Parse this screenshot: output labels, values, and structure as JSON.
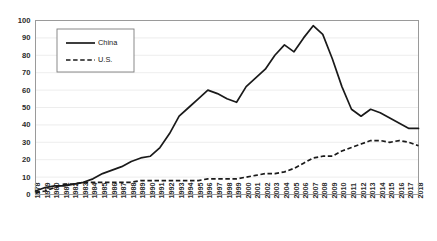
{
  "chart_data": {
    "type": "line",
    "title": "",
    "subtitle": "",
    "xlabel": "",
    "ylabel": "",
    "ylim": [
      0,
      100
    ],
    "ytick_step": 10,
    "yticks": [
      0,
      10,
      20,
      30,
      40,
      50,
      60,
      70,
      80,
      90,
      100
    ],
    "grid": true,
    "grid_axis": "y",
    "legend_position": "top-left-inside",
    "x": [
      "1978",
      "1979",
      "1980",
      "1981",
      "1982",
      "1983",
      "1984",
      "1985",
      "1986",
      "1987",
      "1988",
      "1989",
      "1990",
      "1991",
      "1992",
      "1993",
      "1994",
      "1995",
      "1996",
      "1997",
      "1998",
      "1999",
      "2000",
      "2001",
      "2002",
      "2003",
      "2004",
      "2005",
      "2006",
      "2007",
      "2008",
      "2009",
      "2010",
      "2011",
      "2012",
      "2013",
      "2014",
      "2015",
      "2016",
      "2017",
      "2018"
    ],
    "series": [
      {
        "name": "China",
        "style": "solid",
        "color": "#1a1a1a",
        "values": [
          2,
          4,
          5,
          5,
          6,
          7,
          9,
          12,
          14,
          16,
          19,
          21,
          22,
          27,
          35,
          45,
          50,
          55,
          60,
          58,
          55,
          53,
          62,
          67,
          72,
          80,
          86,
          82,
          90,
          97,
          92,
          78,
          62,
          49,
          45,
          49,
          47,
          44,
          41,
          38,
          38
        ]
      },
      {
        "name": "U.S.",
        "style": "dashed",
        "color": "#1a1a1a",
        "values": [
          1,
          2,
          4,
          6,
          6,
          7,
          7,
          7,
          7,
          7,
          7,
          8,
          8,
          8,
          8,
          8,
          8,
          8,
          9,
          9,
          9,
          9,
          10,
          11,
          12,
          12,
          13,
          15,
          18,
          21,
          22,
          22,
          25,
          27,
          29,
          31,
          31,
          30,
          31,
          30,
          28
        ]
      }
    ],
    "legend": [
      {
        "label": "China",
        "style": "solid"
      },
      {
        "label": "U.S.",
        "style": "dashed"
      }
    ],
    "colors": {
      "background": "#ffffff",
      "grid": "#e8e8e8",
      "axis": "#9a9a9a",
      "text": "#2b2b2b",
      "line": "#1a1a1a"
    }
  }
}
